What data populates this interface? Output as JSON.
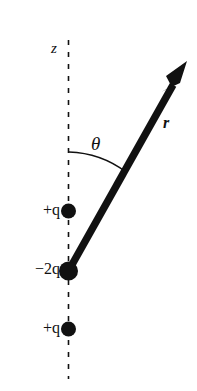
{
  "figure": {
    "background_color": "#ffffff",
    "ink_color": "#111111",
    "width": 197,
    "height": 391
  },
  "axis": {
    "name": "z-axis",
    "label": "z",
    "style": "dashed",
    "x": 68.5,
    "y_top": 40,
    "y_bottom": 379,
    "label_x": 51,
    "label_y": 41
  },
  "charges": [
    {
      "id": "charge-top",
      "label_sign": "+",
      "label_magnitude": "",
      "label_symbol": "q",
      "label_text": "+q",
      "cx": 68.5,
      "cy": 211,
      "radius": 7.5,
      "color": "#111111"
    },
    {
      "id": "charge-middle",
      "label_sign": "−",
      "label_magnitude": "2",
      "label_symbol": "q",
      "label_text": "−2q",
      "cx": 68.5,
      "cy": 271,
      "radius": 9.5,
      "color": "#111111"
    },
    {
      "id": "charge-bottom",
      "label_sign": "+",
      "label_magnitude": "",
      "label_symbol": "q",
      "label_text": "+q",
      "cx": 68.5,
      "cy": 329,
      "radius": 7.5,
      "color": "#111111"
    }
  ],
  "vector": {
    "name": "position-vector-r",
    "label": "r",
    "label_x": 163,
    "label_y": 115,
    "origin_x": 69,
    "origin_y": 270,
    "tip_x": 187,
    "tip_y": 61,
    "shaft_width": 7,
    "color": "#111111"
  },
  "angle": {
    "name": "polar-angle-theta",
    "label": "θ",
    "label_x": 91,
    "label_y": 134,
    "arc_start_x": 69,
    "arc_start_y": 152,
    "arc_end_x": 126,
    "arc_end_y": 172,
    "arc_radius": 100,
    "color": "#111111"
  }
}
